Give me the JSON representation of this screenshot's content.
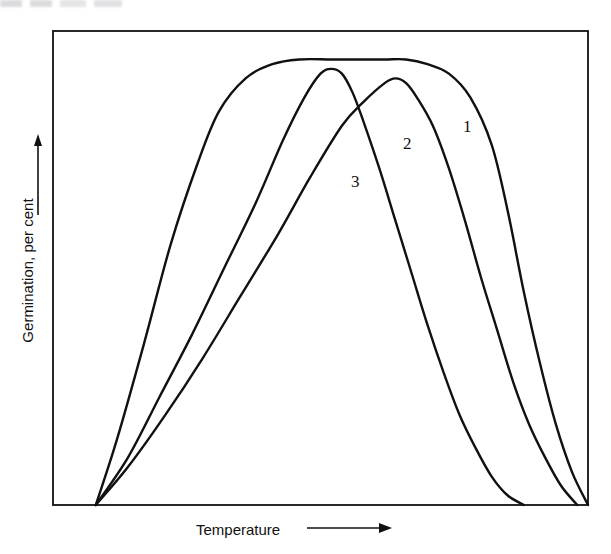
{
  "figure": {
    "background_color": "#ffffff",
    "line_color": "#111111",
    "frame": {
      "x": 53,
      "y": 31,
      "width": 535,
      "height": 474
    }
  },
  "axes": {
    "y_label": "Germination, per cent",
    "y_arrow": "up-arrow",
    "x_label": "Temperature",
    "x_arrow": "right-arrow"
  },
  "curve_tags": [
    {
      "text": "1",
      "x": 463,
      "y": 117
    },
    {
      "text": "2",
      "x": 403,
      "y": 134
    },
    {
      "text": "3",
      "x": 351,
      "y": 172
    }
  ],
  "chart_data": {
    "type": "line",
    "title": "",
    "xlabel": "Temperature",
    "ylabel": "Germination, per cent",
    "xlim": [
      0,
      100
    ],
    "ylim": [
      0,
      100
    ],
    "grid": false,
    "legend": "inline curve numbers 1, 2, 3",
    "axis_ticks": "none",
    "series": [
      {
        "name": "1",
        "label": "1",
        "description": "broad flat-topped plateau; widest temperature tolerance",
        "x": [
          8,
          12,
          17,
          22,
          27,
          31,
          36,
          41,
          46,
          52,
          57,
          62,
          66,
          70,
          74,
          78,
          82,
          85,
          88,
          91,
          94,
          97,
          100
        ],
        "y": [
          0,
          14,
          34,
          55,
          72,
          83,
          90,
          93,
          94,
          94,
          94,
          94,
          94,
          93,
          91,
          86,
          76,
          62,
          45,
          30,
          17,
          7,
          0
        ]
      },
      {
        "name": "2",
        "label": "2",
        "description": "sharp peak at the warmer optimum, right of curve 3",
        "x": [
          8,
          14,
          21,
          28,
          35,
          42,
          48,
          54,
          58,
          62,
          64,
          66,
          68,
          71,
          74,
          77,
          80,
          83,
          86,
          89,
          92,
          95,
          98
        ],
        "y": [
          0,
          8,
          19,
          31,
          44,
          57,
          69,
          80,
          85,
          89,
          90,
          89,
          86,
          80,
          71,
          60,
          48,
          37,
          26,
          17,
          10,
          4,
          0
        ]
      },
      {
        "name": "3",
        "label": "3",
        "description": "sharp peak at the cooler optimum, left of curve 2; crosses curve 2 on its descent",
        "x": [
          8,
          14,
          20,
          26,
          32,
          38,
          43,
          47,
          50,
          52,
          54,
          56,
          58,
          61,
          64,
          67,
          70,
          73,
          76,
          79,
          82,
          85,
          88
        ],
        "y": [
          0,
          10,
          23,
          36,
          50,
          64,
          77,
          86,
          91,
          92,
          91,
          87,
          81,
          71,
          60,
          49,
          38,
          28,
          19,
          12,
          6,
          2,
          0
        ]
      }
    ],
    "features": {
      "common_origin": {
        "x": 8,
        "y": 0,
        "description": "all three curves start from the same point on the baseline"
      },
      "peak_curve_1": {
        "x": 52,
        "y": 94
      },
      "peak_curve_2": {
        "x": 64,
        "y": 90
      },
      "peak_curve_3": {
        "x": 52,
        "y": 92
      },
      "crossing_2_3": {
        "x": 57,
        "y": 83,
        "description": "curve 3 descending crosses curve 2 ascending"
      }
    }
  }
}
